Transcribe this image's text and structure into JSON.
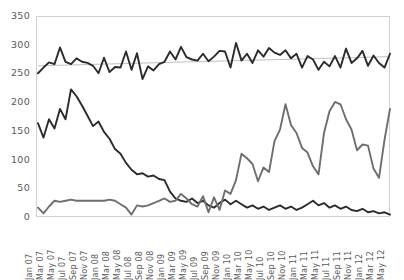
{
  "chart_data": {
    "type": "line",
    "title": "",
    "xlabel": "",
    "ylabel": "",
    "ylim": [
      0,
      350
    ],
    "yticks": [
      0,
      50,
      100,
      150,
      200,
      250,
      300,
      350
    ],
    "grid": false,
    "legend": "none",
    "colors": {
      "series_dark": "#2b2b2b",
      "series_gray": "#6e6e6e",
      "trendline": "#b9b9b9",
      "axis_text": "#5a5a5a",
      "plot_border": "#d2d2d2",
      "background": "#ffffff"
    },
    "x": [
      "Jan 07",
      "Feb 07",
      "Mar 07",
      "Apr 07",
      "May 07",
      "Jun 07",
      "Jul 07",
      "Aug 07",
      "Sep 07",
      "Oct 07",
      "Nov 07",
      "Dec 07",
      "Jan 08",
      "Feb 08",
      "Mar 08",
      "Apr 08",
      "May 08",
      "Jun 08",
      "Jul 08",
      "Aug 08",
      "Sep 08",
      "Oct 08",
      "Nov 08",
      "Dec 08",
      "Jan 09",
      "Feb 09",
      "Mar 09",
      "Apr 09",
      "May 09",
      "Jun 09",
      "Jul 09",
      "Aug 09",
      "Sep 09",
      "Oct 09",
      "Nov 09",
      "Dec 09",
      "Jan 10",
      "Feb 10",
      "Mar 10",
      "Apr 10",
      "May 10",
      "Jun 10",
      "Jul 10",
      "Aug 10",
      "Sep 10",
      "Oct 10",
      "Nov 10",
      "Dec 10",
      "Jan 11",
      "Feb 11",
      "Mar 11",
      "Apr 11",
      "May 11",
      "Jun 11",
      "Jul 11",
      "Aug 11",
      "Sep 11",
      "Oct 11",
      "Nov 11",
      "Dec 11",
      "Jan 12",
      "Feb 12",
      "Mar 12",
      "Apr 12",
      "May 12"
    ],
    "xtick_labels": [
      "Jan 07",
      "Mar 07",
      "May 07",
      "Jul 07",
      "Sep 07",
      "Nov 07",
      "Jan 08",
      "Mar 08",
      "May 08",
      "Jul 08",
      "Sep 08",
      "Nov 08",
      "Jan 09",
      "Mar 09",
      "May 09",
      "Jul 09",
      "Sep 09",
      "Nov 09",
      "Jan 10",
      "Mar 10",
      "May 10",
      "Jul 10",
      "Sep 10",
      "Nov 10",
      "Jan 11",
      "Mar 11",
      "May 11",
      "Jul 11",
      "Sep 11",
      "Nov 11",
      "Jan 12",
      "Mar 12",
      "May 12"
    ],
    "series": [
      {
        "name": "upper-dark-series",
        "color": "#2b2b2b",
        "values": [
          252,
          262,
          271,
          268,
          297,
          272,
          268,
          278,
          272,
          270,
          265,
          252,
          279,
          254,
          263,
          262,
          290,
          258,
          287,
          242,
          264,
          257,
          268,
          272,
          290,
          276,
          298,
          280,
          276,
          274,
          286,
          273,
          281,
          291,
          290,
          262,
          305,
          274,
          286,
          270,
          292,
          281,
          296,
          288,
          284,
          292,
          278,
          286,
          262,
          282,
          276,
          258,
          272,
          264,
          282,
          262,
          295,
          270,
          278,
          291,
          265,
          283,
          270,
          262,
          286
        ]
      },
      {
        "name": "declining-dark-series",
        "color": "#2b2b2b",
        "values": [
          165,
          140,
          172,
          156,
          190,
          172,
          224,
          212,
          196,
          178,
          160,
          168,
          150,
          138,
          120,
          112,
          96,
          84,
          76,
          78,
          72,
          74,
          68,
          66,
          46,
          34,
          30,
          28,
          34,
          26,
          30,
          22,
          18,
          26,
          32,
          24,
          30,
          24,
          18,
          22,
          16,
          20,
          14,
          18,
          22,
          16,
          20,
          14,
          18,
          24,
          30,
          22,
          26,
          18,
          22,
          16,
          20,
          14,
          12,
          16,
          10,
          12,
          8,
          10,
          6
        ]
      },
      {
        "name": "rising-gray-series",
        "color": "#6e6e6e",
        "values": [
          18,
          8,
          20,
          30,
          28,
          30,
          32,
          30,
          30,
          30,
          30,
          30,
          30,
          32,
          30,
          24,
          18,
          6,
          22,
          20,
          22,
          26,
          30,
          34,
          28,
          30,
          42,
          34,
          24,
          20,
          38,
          10,
          36,
          14,
          48,
          42,
          66,
          112,
          104,
          94,
          64,
          88,
          80,
          134,
          154,
          198,
          162,
          148,
          122,
          114,
          90,
          76,
          148,
          186,
          202,
          198,
          172,
          154,
          118,
          128,
          126,
          86,
          70,
          136,
          190
        ]
      }
    ],
    "trendline": {
      "name": "upper-series-trendline",
      "color": "#b9b9b9",
      "start_value": 265,
      "end_value": 281
    }
  }
}
